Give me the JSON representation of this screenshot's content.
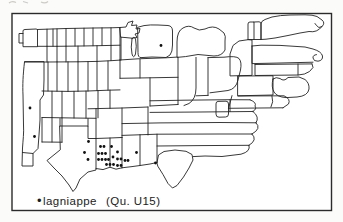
{
  "figure": {
    "caption": {
      "marker": "•",
      "term": "lagniappe",
      "question_ref": "(Qu. U15)"
    }
  },
  "map": {
    "type": "dot-distribution",
    "ink_color": "#232323",
    "dot_color": "#101010",
    "dot_radius": 1.4,
    "markers": [
      {
        "x": 161,
        "y": 45.5
      },
      {
        "x": 30,
        "y": 108
      },
      {
        "x": 34.5,
        "y": 136.5
      },
      {
        "x": 88.5,
        "y": 141.5
      },
      {
        "x": 100.5,
        "y": 146.5
      },
      {
        "x": 104,
        "y": 146.5
      },
      {
        "x": 111.5,
        "y": 146.5
      },
      {
        "x": 84.5,
        "y": 152.5
      },
      {
        "x": 98.5,
        "y": 153.5
      },
      {
        "x": 102,
        "y": 153.5
      },
      {
        "x": 105.5,
        "y": 153.5
      },
      {
        "x": 117.5,
        "y": 152
      },
      {
        "x": 136.5,
        "y": 152.5
      },
      {
        "x": 113,
        "y": 157
      },
      {
        "x": 88,
        "y": 159.5
      },
      {
        "x": 98.5,
        "y": 159.5
      },
      {
        "x": 102,
        "y": 159.5
      },
      {
        "x": 105.5,
        "y": 159.5
      },
      {
        "x": 108.5,
        "y": 159.5
      },
      {
        "x": 117.5,
        "y": 159
      },
      {
        "x": 121,
        "y": 159
      },
      {
        "x": 125,
        "y": 160.5
      },
      {
        "x": 128,
        "y": 160.5
      },
      {
        "x": 106.5,
        "y": 164.5
      },
      {
        "x": 110,
        "y": 164.5
      },
      {
        "x": 113.5,
        "y": 164.5
      },
      {
        "x": 117.5,
        "y": 165.5
      },
      {
        "x": 121,
        "y": 165.5
      },
      {
        "x": 155.5,
        "y": 163
      }
    ]
  }
}
